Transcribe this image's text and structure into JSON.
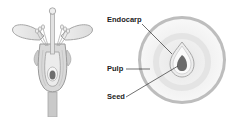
{
  "diagram": {
    "left_figure": "flower-longitudinal-section",
    "right_figure": "fruit-cross-section",
    "labels": [
      {
        "id": "endocarp",
        "text": "Endocarp"
      },
      {
        "id": "pulp",
        "text": "Pulp"
      },
      {
        "id": "seed",
        "text": "Seed"
      }
    ],
    "colors": {
      "outline": "#9a9a9a",
      "fill_light": "#e6e6e6",
      "fill_mid": "#cfcfcf",
      "seed": "#6e6e6e",
      "leader_line": "#333333",
      "text": "#222222"
    }
  }
}
